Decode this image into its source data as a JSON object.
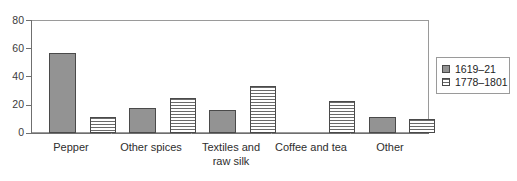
{
  "chart_data": {
    "type": "bar",
    "title": "",
    "subtitle": "",
    "xlabel": "",
    "ylabel": "",
    "ylim": [
      0,
      80
    ],
    "ytick_labels": [
      "0",
      "20",
      "40",
      "60",
      "80"
    ],
    "ytick_values": [
      0,
      20,
      40,
      60,
      80
    ],
    "grid": false,
    "legend_position": "right",
    "categories": [
      "Pepper",
      "Other spices",
      "Textiles and raw silk",
      "Coffee and tea",
      "Other"
    ],
    "category_labels": [
      [
        "Pepper"
      ],
      [
        "Other spices"
      ],
      [
        "Textiles and",
        "raw silk"
      ],
      [
        "Coffee and tea"
      ],
      [
        "Other"
      ]
    ],
    "series": [
      {
        "name": "1619–21",
        "fill": "solid-gray",
        "color": "#939393",
        "values": [
          57,
          18,
          16,
          0,
          11
        ]
      },
      {
        "name": "1778–1801",
        "fill": "horizontal-stripes",
        "color": "#ffffff",
        "values": [
          11,
          25,
          33,
          23,
          10
        ]
      }
    ]
  },
  "legend": {
    "entries": [
      {
        "label": "1619–21",
        "swatch": "solid-swatch-icon"
      },
      {
        "label": "1778–1801",
        "swatch": "striped-swatch-icon"
      }
    ]
  },
  "axes": {
    "y_labels": [
      "80",
      "60",
      "40",
      "20",
      "0"
    ]
  }
}
